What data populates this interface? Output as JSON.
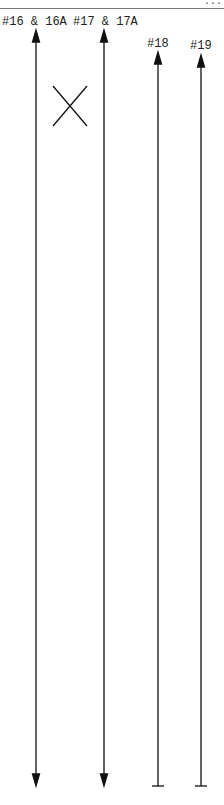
{
  "diagram": {
    "header_fragment": "...",
    "labels": [
      {
        "id": "16",
        "text": "#16 & 16A",
        "x": 2,
        "y": 15
      },
      {
        "id": "17",
        "text": "#17 & 17A",
        "x": 73,
        "y": 15
      },
      {
        "id": "18",
        "text": "#18",
        "x": 147,
        "y": 37
      },
      {
        "id": "19",
        "text": "#19",
        "x": 190,
        "y": 39
      }
    ],
    "lines": [
      {
        "id": "16",
        "x": 36,
        "y_top": 30,
        "y_bottom": 786,
        "start": "arrow",
        "end": "arrow"
      },
      {
        "id": "17",
        "x": 104,
        "y_top": 30,
        "y_bottom": 786,
        "start": "arrow",
        "end": "arrow"
      },
      {
        "id": "18",
        "x": 158,
        "y_top": 52,
        "y_bottom": 786,
        "start": "arrow",
        "end": "bar"
      },
      {
        "id": "19",
        "x": 201,
        "y_top": 55,
        "y_bottom": 786,
        "start": "arrow",
        "end": "bar"
      }
    ],
    "marker": {
      "shape": "x",
      "x1": 53,
      "y1": 86,
      "x2": 87,
      "y2": 126
    },
    "colors": {
      "line": "#111111",
      "rule": "#777777",
      "text": "#222222"
    }
  }
}
